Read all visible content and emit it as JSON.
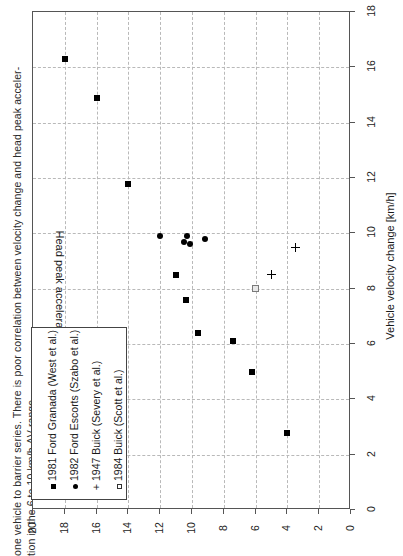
{
  "caption": {
    "line1": "one vehicle to barrier series. There is poor correlation between velocity change and head peak acceler-",
    "line2": "tion in the 6 to 10 km/h ΔV range."
  },
  "chart_data": {
    "type": "scatter",
    "title": "",
    "xlabel": "Vehicle velocity change [km/h]",
    "ylabel": "Head peak acceleration [g]",
    "xlim": [
      0,
      18
    ],
    "ylim": [
      0,
      20
    ],
    "xticks": [
      "0",
      "2",
      "4",
      "6",
      "8",
      "10",
      "12",
      "14",
      "16",
      "18"
    ],
    "yticks": [
      "0",
      "2",
      "4",
      "6",
      "8",
      "10",
      "12",
      "14",
      "16",
      "18",
      "20"
    ],
    "grid": true,
    "legend_position": "bottom-left",
    "series": [
      {
        "name": "1981 Ford Granada (West et al.)",
        "marker": "filled-square",
        "points": [
          [
            16.3,
            18.0
          ],
          [
            14.9,
            16.0
          ],
          [
            11.8,
            14.0
          ],
          [
            8.5,
            11.0
          ],
          [
            7.6,
            10.4
          ],
          [
            6.4,
            9.6
          ],
          [
            6.1,
            7.4
          ],
          [
            5.0,
            6.2
          ],
          [
            2.8,
            4.0
          ]
        ]
      },
      {
        "name": "1982 Ford Escorts (Szabo et al.)",
        "marker": "filled-circle",
        "points": [
          [
            9.9,
            12.0
          ],
          [
            9.7,
            10.5
          ],
          [
            9.9,
            10.3
          ],
          [
            9.6,
            10.1
          ],
          [
            9.8,
            9.2
          ]
        ]
      },
      {
        "name": "1947 Buick (Severy et al.)",
        "marker": "plus",
        "points": [
          [
            9.5,
            3.5
          ],
          [
            8.5,
            5.0
          ]
        ]
      },
      {
        "name": "1984 Buick (Scott et al.)",
        "marker": "open-square",
        "points": [
          [
            8.0,
            6.0
          ]
        ]
      }
    ]
  }
}
